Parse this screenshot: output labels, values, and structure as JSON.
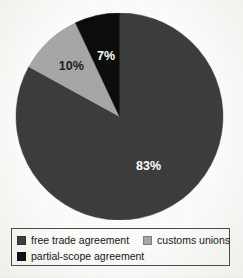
{
  "chart_data": {
    "type": "pie",
    "title": "",
    "subtitle": "",
    "xlabel": "",
    "ylabel": "",
    "grid": false,
    "legend_position": "bottom",
    "start_angle_deg": 0,
    "direction": "clockwise",
    "categories": [
      "free trade agreement",
      "customs unions",
      "partial-scope agreement"
    ],
    "values": [
      83,
      10,
      7
    ],
    "value_unit": "%",
    "data_labels": [
      "83%",
      "10%",
      "7%"
    ],
    "colors": [
      "#3d3d3d",
      "#a8a8a8",
      "#0d0d0d"
    ],
    "slices": [
      {
        "label": "free trade agreement",
        "value": 83,
        "data_label": "83%",
        "color": "#3d3d3d",
        "label_color": "#ffffff",
        "start_deg": 0,
        "end_deg": 298.8
      },
      {
        "label": "customs unions",
        "value": 10,
        "data_label": "10%",
        "color": "#a8a8a8",
        "label_color": "#1d1d1d",
        "start_deg": 298.8,
        "end_deg": 334.8
      },
      {
        "label": "partial-scope agreement",
        "value": 7,
        "data_label": "7%",
        "color": "#0d0d0d",
        "label_color": "#ffffff",
        "start_deg": 334.8,
        "end_deg": 360
      }
    ]
  },
  "legend": {
    "rows": [
      {
        "entries": [
          {
            "label": "free trade agreement",
            "color": "#3d3d3d",
            "swatch_name": "legend-swatch-free-trade-agreement"
          },
          {
            "label": "customs unions",
            "color": "#a8a8a8",
            "swatch_name": "legend-swatch-customs-unions"
          }
        ]
      },
      {
        "entries": [
          {
            "label": "partial-scope agreement",
            "color": "#0d0d0d",
            "swatch_name": "legend-swatch-partial-scope-agreement"
          }
        ]
      }
    ]
  }
}
